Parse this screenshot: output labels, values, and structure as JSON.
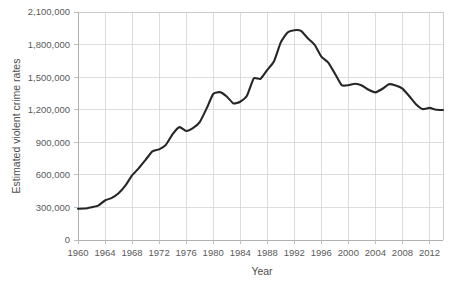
{
  "chart_data": {
    "type": "line",
    "title": "",
    "subtitle": "",
    "xlabel": "Year",
    "ylabel": "Estimated violent crime rates",
    "xlim": [
      1960,
      2014
    ],
    "ylim": [
      0,
      2100000
    ],
    "grid": true,
    "legend": false,
    "legend_position": "none",
    "line_color": "#262626",
    "grid_color": "#d4d4d4",
    "tick_label_color": "#5a5a5a",
    "axis_title_color": "#4d4d4d",
    "x_ticks": [
      1960,
      1964,
      1968,
      1972,
      1976,
      1980,
      1984,
      1988,
      1992,
      1996,
      2000,
      2004,
      2008,
      2012
    ],
    "x_tick_labels": [
      "1960",
      "1964",
      "1968",
      "1972",
      "1976",
      "1980",
      "1984",
      "1988",
      "1992",
      "1996",
      "2000",
      "2004",
      "2008",
      "2012"
    ],
    "y_ticks": [
      0,
      300000,
      600000,
      900000,
      1200000,
      1500000,
      1800000,
      2100000
    ],
    "y_tick_labels": [
      "0",
      "300,000",
      "600,000",
      "900,000",
      "1,200,000",
      "1,500,000",
      "1,800,000",
      "2,100,000"
    ],
    "series": [
      {
        "name": "Estimated violent crime rates",
        "x": [
          1960,
          1961,
          1962,
          1963,
          1964,
          1965,
          1966,
          1967,
          1968,
          1969,
          1970,
          1971,
          1972,
          1973,
          1974,
          1975,
          1976,
          1977,
          1978,
          1979,
          1980,
          1981,
          1982,
          1983,
          1984,
          1985,
          1986,
          1987,
          1988,
          1989,
          1990,
          1991,
          1992,
          1993,
          1994,
          1995,
          1996,
          1997,
          1998,
          1999,
          2000,
          2001,
          2002,
          2003,
          2004,
          2005,
          2006,
          2007,
          2008,
          2009,
          2010,
          2011,
          2012,
          2013,
          2014
        ],
        "values": [
          288460,
          289390,
          301510,
          316970,
          364220,
          387390,
          430180,
          499930,
          595010,
          661870,
          738820,
          816500,
          834900,
          875910,
          974720,
          1039710,
          1004210,
          1029580,
          1085550,
          1208030,
          1344520,
          1361820,
          1322390,
          1258090,
          1273280,
          1328800,
          1489170,
          1484000,
          1566220,
          1646040,
          1820130,
          1911770,
          1932270,
          1926020,
          1857670,
          1798790,
          1688540,
          1636100,
          1533890,
          1426040,
          1425490,
          1439480,
          1423680,
          1383680,
          1360090,
          1390750,
          1435120,
          1422970,
          1394460,
          1325900,
          1251250,
          1206030,
          1217060,
          1199680,
          1197990
        ]
      }
    ],
    "annotations": []
  },
  "axes": {
    "y_axis_title": "Estimated violent crime rates",
    "x_axis_title": "Year"
  }
}
